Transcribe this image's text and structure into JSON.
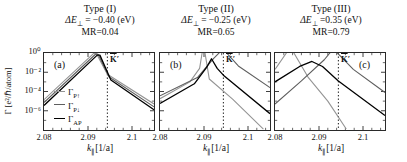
{
  "chart_data": [
    {
      "type": "line",
      "title": "Type (I)",
      "subtitle_delta_base": "ΔE",
      "subtitle_delta_sub": "⊥",
      "subtitle_delta_rest": " = −0.40 (eV)",
      "subtitle_mr": "MR=0.04",
      "panel_label": "(a)",
      "xlabel_base": "k",
      "xlabel_sub": "∥",
      "xlabel_rest": "[1/a]",
      "ylabel": "Γ [e²/ℏ/atom]",
      "xlim": [
        2.08,
        2.105
      ],
      "ylim_log10": [
        -8,
        0
      ],
      "x_ticks": [
        2.08,
        2.09,
        2.1
      ],
      "x_tick_labels": [
        "2.08",
        "2.09",
        "2.1"
      ],
      "y_tick_labels": [
        "10⁰",
        "10⁻²",
        "10⁻⁴",
        "10⁻⁶"
      ],
      "kprime_value": 2.0944,
      "kprime_label_base": "K",
      "kprime_label_prime": "′",
      "legend": [
        {
          "base": "Γ",
          "sub": "P↑",
          "color": "#949494"
        },
        {
          "base": "Γ",
          "sub": "P↓",
          "color": "#5e5e5e"
        },
        {
          "base": "Γ",
          "sub": "AP",
          "color": "#000000"
        }
      ],
      "series": [
        {
          "name": "Γ_P↑",
          "color": "#949494",
          "width": 1.1,
          "points_k_log10gamma": [
            [
              2.08,
              -4.85
            ],
            [
              2.0913,
              -0.04
            ],
            [
              2.0919,
              -0.04
            ],
            [
              2.0944,
              -2.2
            ],
            [
              2.105,
              -5.3
            ]
          ]
        },
        {
          "name": "Γ_P↓",
          "color": "#5e5e5e",
          "width": 1.1,
          "points_k_log10gamma": [
            [
              2.08,
              -5.15
            ],
            [
              2.0917,
              -0.13
            ],
            [
              2.0923,
              -0.13
            ],
            [
              2.0948,
              -2.5
            ],
            [
              2.105,
              -5.6
            ]
          ]
        },
        {
          "name": "Γ_AP",
          "color": "#000000",
          "width": 1.3,
          "points_k_log10gamma": [
            [
              2.08,
              -5.45
            ],
            [
              2.0921,
              -0.22
            ],
            [
              2.0927,
              -0.22
            ],
            [
              2.0952,
              -2.8
            ],
            [
              2.105,
              -5.9
            ]
          ]
        }
      ]
    },
    {
      "type": "line",
      "title": "Type (II)",
      "subtitle_delta_base": "ΔE",
      "subtitle_delta_sub": "⊥",
      "subtitle_delta_rest": " = −0.25 (eV)",
      "subtitle_mr": "MR=0.65",
      "panel_label": "(b)",
      "xlabel_base": "k",
      "xlabel_sub": "∥",
      "xlabel_rest": "[1/a]",
      "xlim": [
        2.08,
        2.105
      ],
      "ylim_log10": [
        -8,
        0
      ],
      "x_ticks": [
        2.08,
        2.09,
        2.1
      ],
      "x_tick_labels": [
        "2.08",
        "2.09",
        "2.1"
      ],
      "kprime_value": 2.0944,
      "kprime_label_base": "K",
      "kprime_label_prime": "′",
      "series": [
        {
          "name": "Γ_P↑",
          "color": "#949494",
          "width": 1.1,
          "points_k_log10gamma": [
            [
              2.08,
              -4.75
            ],
            [
              2.0868,
              -3.0
            ],
            [
              2.089,
              -1.6
            ],
            [
              2.0896,
              0.08
            ],
            [
              2.0902,
              0.08
            ],
            [
              2.0912,
              -2.7
            ],
            [
              2.0965,
              -4.8
            ],
            [
              2.1035,
              -7.9
            ]
          ]
        },
        {
          "name": "Γ_P↓",
          "color": "#5e5e5e",
          "width": 1.1,
          "points_k_log10gamma": [
            [
              2.08,
              -4.45
            ],
            [
              2.0885,
              -2.55
            ],
            [
              2.0922,
              -0.55
            ],
            [
              2.0936,
              0.08
            ],
            [
              2.095,
              0.08
            ],
            [
              2.0978,
              -1.35
            ],
            [
              2.105,
              -3.6
            ]
          ]
        },
        {
          "name": "Γ_AP",
          "color": "#000000",
          "width": 1.3,
          "points_k_log10gamma": [
            [
              2.08,
              -5.25
            ],
            [
              2.0878,
              -3.2
            ],
            [
              2.0906,
              -1.5
            ],
            [
              2.0917,
              -0.6
            ],
            [
              2.093,
              -1.6
            ],
            [
              2.0944,
              -2.3
            ],
            [
              2.105,
              -6.3
            ]
          ]
        }
      ]
    },
    {
      "type": "line",
      "title": "Type (III)",
      "subtitle_delta_base": "ΔE",
      "subtitle_delta_sub": "⊥",
      "subtitle_delta_rest": " =0.35 (eV)",
      "subtitle_mr": "MR=0.79",
      "panel_label": "(c)",
      "xlabel_base": "k",
      "xlabel_sub": "∥",
      "xlabel_rest": "[1/a]",
      "xlim": [
        2.08,
        2.105
      ],
      "ylim_log10": [
        -8,
        0
      ],
      "x_ticks": [
        2.08,
        2.09,
        2.1
      ],
      "x_tick_labels": [
        "2.08",
        "2.09",
        "2.1"
      ],
      "kprime_value": 2.0944,
      "kprime_label_base": "K",
      "kprime_label_prime": "′",
      "series": [
        {
          "name": "Γ_P↑",
          "color": "#949494",
          "width": 1.1,
          "points_k_log10gamma": [
            [
              2.08,
              -1.7
            ],
            [
              2.0827,
              0.08
            ],
            [
              2.0842,
              0.08
            ],
            [
              2.0875,
              -2.5
            ],
            [
              2.092,
              -5.0
            ],
            [
              2.0962,
              -7.9
            ]
          ]
        },
        {
          "name": "Γ_P↓",
          "color": "#5e5e5e",
          "width": 1.1,
          "points_k_log10gamma": [
            [
              2.08,
              -5.3
            ],
            [
              2.086,
              -2.9
            ],
            [
              2.0912,
              -0.7
            ],
            [
              2.0926,
              0.08
            ],
            [
              2.094,
              0.08
            ],
            [
              2.0978,
              -1.7
            ],
            [
              2.105,
              -4.1
            ]
          ]
        },
        {
          "name": "Γ_AP",
          "color": "#000000",
          "width": 1.3,
          "points_k_log10gamma": [
            [
              2.08,
              -3.0
            ],
            [
              2.0856,
              -1.4
            ],
            [
              2.0884,
              -0.88
            ],
            [
              2.0908,
              -1.4
            ],
            [
              2.0944,
              -2.9
            ],
            [
              2.105,
              -6.5
            ]
          ]
        }
      ]
    }
  ]
}
